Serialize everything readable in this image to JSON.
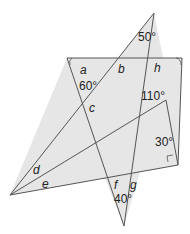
{
  "diagram": {
    "type": "geometry-angles",
    "colors": {
      "fill": "#e6e6e6",
      "stroke": "#555555",
      "text": "#222222"
    },
    "labels": {
      "a": "a",
      "b": "b",
      "h": "h",
      "c": "c",
      "d": "d",
      "e": "e",
      "f": "f",
      "g": "g",
      "ang50": "50°",
      "ang60": "60°",
      "ang110": "110°",
      "ang30": "30°",
      "ang40": "40°"
    }
  }
}
